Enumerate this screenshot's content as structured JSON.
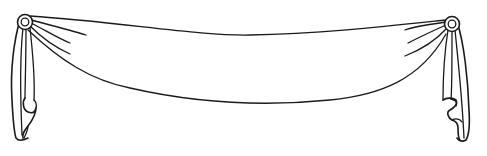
{
  "illustration": {
    "title": "Swag banner line drawing",
    "style": "black ink outline on white",
    "colors": {
      "background": "#ffffff",
      "stroke": "#1a1a1a"
    },
    "elements": [
      {
        "name": "left-rosette",
        "cx": 25,
        "cy": 22,
        "r": 7
      },
      {
        "name": "right-rosette",
        "cx": 452,
        "cy": 24,
        "r": 7
      },
      {
        "name": "swag-fabric",
        "top_edge_sag_y": 35,
        "bottom_edge_sag_y": 104
      },
      {
        "name": "left-tail",
        "bottom_y": 140
      },
      {
        "name": "right-tail",
        "bottom_y": 141
      }
    ]
  }
}
